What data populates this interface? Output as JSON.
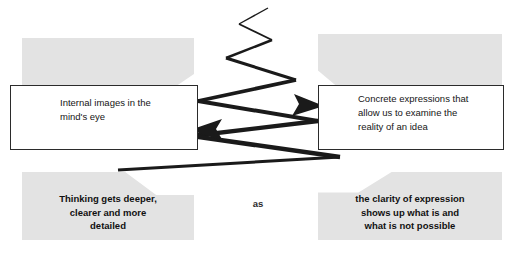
{
  "diagram": {
    "connector_label": "as",
    "colors": {
      "panel_gray": "#e3e3e3",
      "box_border": "#2b2b2b",
      "box_fill": "#ffffff",
      "arrow": "#1a1a1a",
      "text": "#151515",
      "background": "#ffffff"
    },
    "boxes": [
      {
        "id": "left-box",
        "text": "Internal images in the\nmind's eye"
      },
      {
        "id": "right-box",
        "text": "Concrete expressions that\nallow us to examine the\nreality of an idea"
      }
    ],
    "panels": [
      {
        "id": "top-left-panel",
        "text": ""
      },
      {
        "id": "top-right-panel",
        "text": ""
      },
      {
        "id": "bottom-left-panel",
        "text": "Thinking gets deeper,\nclearer and more\ndetailed"
      },
      {
        "id": "bottom-right-panel",
        "text": "the clarity of expression\nshows up what is and\nwhat is not possible"
      }
    ],
    "arrows": [
      {
        "id": "arrow-to-right-box",
        "direction": "right",
        "from": "left-box",
        "to": "right-box"
      },
      {
        "id": "arrow-to-left-box",
        "direction": "left",
        "from": "right-box",
        "to": "left-box"
      }
    ]
  }
}
